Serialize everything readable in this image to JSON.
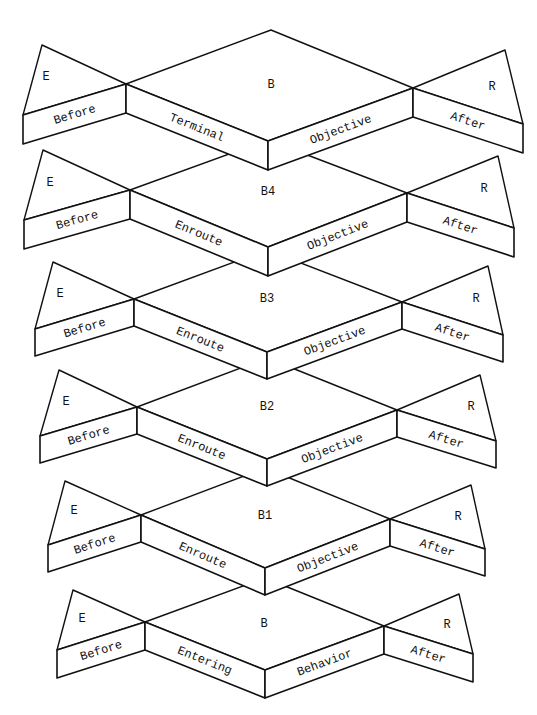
{
  "diagram": {
    "type": "stacked-3d-blocks",
    "blocks": [
      {
        "id": "terminal",
        "center_label": "B",
        "left_label": "E",
        "right_label": "R",
        "face_left": "Before",
        "face_center_left": "Terminal",
        "face_center_right": "Objective",
        "face_right": "After",
        "geom": {
          "etop": [
            42,
            45
          ],
          "ltip": [
            23,
            115
          ],
          "lj": [
            126,
            84
          ],
          "ctop": [
            271,
            30
          ],
          "cbot": [
            268,
            141
          ],
          "rj": [
            413,
            88
          ],
          "rtop": [
            505,
            50
          ],
          "rtip": [
            523,
            124
          ],
          "d": 29,
          "clab": [
            271,
            88
          ],
          "elab": [
            46,
            80
          ],
          "rlab": [
            492,
            90
          ]
        }
      },
      {
        "id": "b4",
        "center_label": "B4",
        "left_label": "E",
        "right_label": "R",
        "face_left": "Before",
        "face_center_left": "Enroute",
        "face_center_right": "Objective",
        "face_right": "After",
        "geom": {
          "etop": [
            43,
            150
          ],
          "ltip": [
            24,
            220
          ],
          "lj": [
            130,
            190
          ],
          "ctop": [
            268,
            140
          ],
          "cbot": [
            268,
            247
          ],
          "rj": [
            407,
            193
          ],
          "rtop": [
            498,
            156
          ],
          "rtip": [
            514,
            228
          ],
          "d": 29,
          "clab": [
            268,
            195
          ],
          "elab": [
            50,
            186
          ],
          "rlab": [
            484,
            192
          ]
        }
      },
      {
        "id": "b3",
        "center_label": "B3",
        "left_label": "E",
        "right_label": "R",
        "face_left": "Before",
        "face_center_left": "Enroute",
        "face_center_right": "Objective",
        "face_right": "After",
        "geom": {
          "etop": [
            53,
            262
          ],
          "ltip": [
            35,
            329
          ],
          "lj": [
            134,
            299
          ],
          "ctop": [
            267,
            250
          ],
          "cbot": [
            267,
            352
          ],
          "rj": [
            402,
            302
          ],
          "rtop": [
            488,
            266
          ],
          "rtip": [
            503,
            335
          ],
          "d": 27,
          "clab": [
            267,
            302
          ],
          "elab": [
            60,
            297
          ],
          "rlab": [
            476,
            302
          ]
        }
      },
      {
        "id": "b2",
        "center_label": "B2",
        "left_label": "E",
        "right_label": "R",
        "face_left": "Before",
        "face_center_left": "Enroute",
        "face_center_right": "Objective",
        "face_right": "After",
        "geom": {
          "etop": [
            59,
            370
          ],
          "ltip": [
            40,
            436
          ],
          "lj": [
            137,
            407
          ],
          "ctop": [
            267,
            358
          ],
          "cbot": [
            267,
            459
          ],
          "rj": [
            397,
            410
          ],
          "rtop": [
            480,
            375
          ],
          "rtip": [
            496,
            441
          ],
          "d": 27,
          "clab": [
            267,
            410
          ],
          "elab": [
            66,
            405
          ],
          "rlab": [
            471,
            410
          ]
        }
      },
      {
        "id": "b1",
        "center_label": "B1",
        "left_label": "E",
        "right_label": "R",
        "face_left": "Before",
        "face_center_left": "Enroute",
        "face_center_right": "Objective",
        "face_right": "After",
        "geom": {
          "etop": [
            65,
            481
          ],
          "ltip": [
            48,
            545
          ],
          "lj": [
            141,
            515
          ],
          "ctop": [
            265,
            468
          ],
          "cbot": [
            265,
            568
          ],
          "rj": [
            390,
            519
          ],
          "rtop": [
            471,
            485
          ],
          "rtip": [
            485,
            549
          ],
          "d": 27,
          "clab": [
            265,
            519
          ],
          "elab": [
            74,
            514
          ],
          "rlab": [
            458,
            520
          ]
        }
      },
      {
        "id": "entering",
        "center_label": "B",
        "left_label": "E",
        "right_label": "R",
        "face_left": "Before",
        "face_center_left": "Entering",
        "face_center_right": "Behavior",
        "face_right": "After",
        "geom": {
          "etop": [
            73,
            590
          ],
          "ltip": [
            57,
            650
          ],
          "lj": [
            145,
            622
          ],
          "ctop": [
            265,
            578
          ],
          "cbot": [
            265,
            670
          ],
          "rj": [
            384,
            626
          ],
          "rtop": [
            459,
            594
          ],
          "rtip": [
            473,
            654
          ],
          "d": 28,
          "clab": [
            264,
            627
          ],
          "elab": [
            82,
            622
          ],
          "rlab": [
            447,
            628
          ]
        }
      }
    ]
  }
}
